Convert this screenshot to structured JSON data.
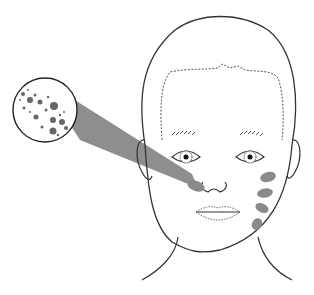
{
  "figure": {
    "colors": {
      "outline": "#333333",
      "lesion": "#8a8a8a",
      "beam": "#7a7a7a",
      "background": "#ffffff"
    },
    "inset": {
      "label": "magnified-lesion-inset"
    },
    "cheek_lesions_right_count": 4,
    "cheek_lesions_left_count": 1
  }
}
